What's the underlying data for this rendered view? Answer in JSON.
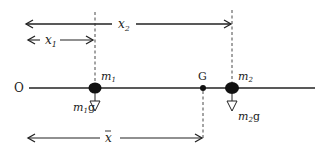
{
  "diagram": {
    "type": "centre-of-mass-two-particles",
    "origin_label": "O",
    "masses": [
      {
        "id": "m1",
        "label": "m",
        "subscript": "1",
        "weight_label": "m",
        "weight_subscript": "1",
        "weight_suffix": "g",
        "x": 95
      },
      {
        "id": "m2",
        "label": "m",
        "subscript": "2",
        "weight_label": "m",
        "weight_subscript": "2",
        "weight_suffix": "g",
        "x": 232
      }
    ],
    "centre_of_mass": {
      "label": "G",
      "x": 203
    },
    "dimensions": [
      {
        "id": "x1",
        "label": "x",
        "subscript": "1",
        "from": "O",
        "to": "m1"
      },
      {
        "id": "x2",
        "label": "x",
        "subscript": "2",
        "from": "O",
        "to": "m2"
      },
      {
        "id": "xbar",
        "label": "x",
        "overbar": true,
        "from": "O",
        "to": "G"
      }
    ],
    "colors": {
      "line": "#222222",
      "dashed": "#333333",
      "fill": "#111111",
      "background": "#ffffff"
    }
  }
}
